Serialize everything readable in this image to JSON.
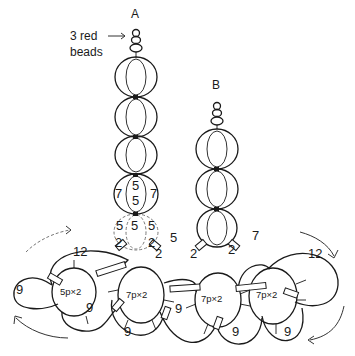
{
  "diagram": {
    "strand_a_label": "A",
    "strand_b_label": "B",
    "note_line1": "3 red",
    "note_line2": "beads",
    "labels": {
      "a_loop_7_left": "7",
      "a_loop_7_right": "7",
      "a_loop_5_top": "5",
      "a_loop_5_mid": "5",
      "a_loop_5_left": "5",
      "a_loop_5_center": "5",
      "a_loop_5_right": "5",
      "a_2_left": "2",
      "a_2_right": "2",
      "bridge_5": "5",
      "bridge_2_left": "2",
      "bridge_2_right": "2",
      "b_7": "7",
      "b_2": "2",
      "left_12": "12",
      "left_9_outer": "9",
      "left_9_inner": "9",
      "left_center": "5p×2",
      "mid_center_left": "7p×2",
      "mid_center_right": "7p×2",
      "right_center": "7p×2",
      "right_12": "12",
      "bottom_9_a": "9",
      "bottom_9_b": "9",
      "bottom_9_c": "9",
      "bottom_9_d": "9"
    }
  }
}
